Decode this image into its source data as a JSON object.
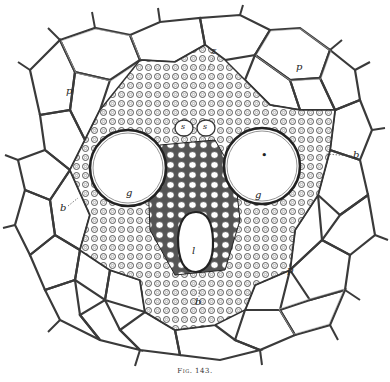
{
  "figure": {
    "caption": "Fig. 143.",
    "line_color": "#3a3a3a",
    "background": "#ffffff"
  },
  "labels": [
    {
      "id": "p_top_left",
      "text": "p",
      "x": 68,
      "y": 92
    },
    {
      "id": "z_top",
      "text": "z",
      "x": 213,
      "y": 52
    },
    {
      "id": "p_top_right",
      "text": "p",
      "x": 298,
      "y": 68
    },
    {
      "id": "s_left",
      "text": "s",
      "x": 183,
      "y": 130
    },
    {
      "id": "s_right",
      "text": "s",
      "x": 205,
      "y": 130
    },
    {
      "id": "b_right",
      "text": "b",
      "x": 353,
      "y": 156
    },
    {
      "id": "v_dot",
      "text": "•",
      "x": 265,
      "y": 155
    },
    {
      "id": "b_left",
      "text": "b",
      "x": 62,
      "y": 209
    },
    {
      "id": "g_left",
      "text": "g",
      "x": 128,
      "y": 194
    },
    {
      "id": "g_right",
      "text": "g",
      "x": 257,
      "y": 196
    },
    {
      "id": "l_center",
      "text": "l",
      "x": 193,
      "y": 253
    },
    {
      "id": "p_right",
      "text": "p",
      "x": 289,
      "y": 271
    },
    {
      "id": "b_bottom",
      "text": "b",
      "x": 197,
      "y": 302
    }
  ]
}
